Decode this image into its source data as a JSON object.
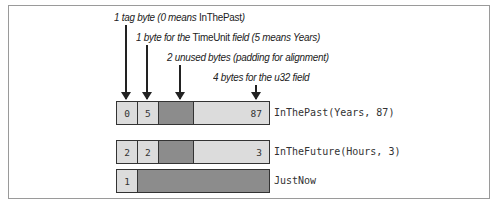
{
  "annotations": [
    {
      "pre": "1 tag byte (0 means ",
      "upright": "InThePast",
      "post": ")"
    },
    {
      "pre": "1 byte for the ",
      "upright": "TimeUnit",
      "post": " field (5 means Years)"
    },
    {
      "pre": "2 unused bytes (padding for alignment)",
      "upright": "",
      "post": ""
    },
    {
      "pre": "4 bytes for the u32 field",
      "upright": "",
      "post": ""
    }
  ],
  "rows": [
    {
      "tag": "0",
      "unit": "5",
      "value": "87",
      "label": "InThePast(Years, 87)"
    },
    {
      "tag": "2",
      "unit": "2",
      "value": "3",
      "label": "InTheFuture(Hours, 3)"
    },
    {
      "tag": "1",
      "label": "JustNow"
    }
  ],
  "colors": {
    "light_cell": "#dcdcdc",
    "dark_cell": "#8c8c8c",
    "border": "#333333"
  }
}
